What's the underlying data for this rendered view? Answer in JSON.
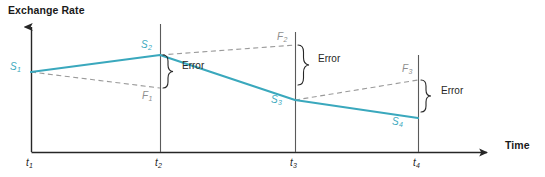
{
  "figure": {
    "title": "Exchange Rate",
    "width": 545,
    "height": 177,
    "background": "#ffffff"
  },
  "axes": {
    "y": {
      "label": "Exchange Rate",
      "arrow": true,
      "color": "#262626"
    },
    "x": {
      "label": "Time",
      "arrow": true,
      "color": "#262626"
    },
    "ticks": [
      {
        "id": "t1",
        "base": "t",
        "sub": "1",
        "x": 31
      },
      {
        "id": "t2",
        "base": "t",
        "sub": "2",
        "x": 160
      },
      {
        "id": "t3",
        "base": "t",
        "sub": "3",
        "x": 295
      },
      {
        "id": "t4",
        "base": "t",
        "sub": "4",
        "x": 418
      }
    ]
  },
  "colors": {
    "spot_line": "#3aa8bd",
    "forecast_line": "#9a9a9a",
    "axis": "#262626",
    "gridline": "#5a5a5a",
    "text": "#1a1a1a"
  },
  "series": {
    "spot": {
      "name": "Spot exchange rate",
      "style": "solid",
      "color": "#3aa8bd",
      "points": [
        {
          "label_base": "S",
          "label_sub": "1",
          "x": 31,
          "y": 72
        },
        {
          "label_base": "S",
          "label_sub": "2",
          "x": 160,
          "y": 55
        },
        {
          "label_base": "S",
          "label_sub": "3",
          "x": 295,
          "y": 100
        },
        {
          "label_base": "S",
          "label_sub": "4",
          "x": 418,
          "y": 118
        }
      ]
    },
    "forecast": {
      "name": "Forward / forecast rate",
      "style": "dashed",
      "color": "#9a9a9a",
      "segments": [
        {
          "from_x": 31,
          "from_y": 72,
          "to_x": 160,
          "to_y": 88,
          "label_base": "F",
          "label_sub": "1"
        },
        {
          "from_x": 160,
          "from_y": 55,
          "to_x": 295,
          "to_y": 45,
          "label_base": "F",
          "label_sub": "2"
        },
        {
          "from_x": 295,
          "from_y": 100,
          "to_x": 418,
          "to_y": 80,
          "label_base": "F",
          "label_sub": "3"
        }
      ]
    }
  },
  "errors": [
    {
      "label": "Error",
      "x": 163,
      "top": 55,
      "bottom": 88,
      "text_x": 182,
      "text_y": 66
    },
    {
      "label": "Error",
      "x": 298,
      "top": 45,
      "bottom": 85,
      "text_x": 318,
      "text_y": 60
    },
    {
      "label": "Error",
      "x": 421,
      "top": 80,
      "bottom": 112,
      "text_x": 441,
      "text_y": 91
    }
  ],
  "spot_labels": [
    {
      "base": "S",
      "sub": "1",
      "x": 10,
      "y": 62
    },
    {
      "base": "S",
      "sub": "2",
      "x": 141,
      "y": 40
    },
    {
      "base": "S",
      "sub": "3",
      "x": 271,
      "y": 95
    },
    {
      "base": "S",
      "sub": "4",
      "x": 392,
      "y": 117
    }
  ],
  "forecast_labels": [
    {
      "base": "F",
      "sub": "1",
      "x": 142,
      "y": 91
    },
    {
      "base": "F",
      "sub": "2",
      "x": 277,
      "y": 32
    },
    {
      "base": "F",
      "sub": "3",
      "x": 402,
      "y": 64
    }
  ],
  "tick_labels": [
    {
      "base": "t",
      "sub": "1",
      "x": 26,
      "y": 158
    },
    {
      "base": "t",
      "sub": "2",
      "x": 155,
      "y": 158
    },
    {
      "base": "t",
      "sub": "3",
      "x": 290,
      "y": 158
    },
    {
      "base": "t",
      "sub": "4",
      "x": 413,
      "y": 158
    }
  ],
  "time_label": {
    "text": "Time",
    "x": 505,
    "y": 145
  }
}
